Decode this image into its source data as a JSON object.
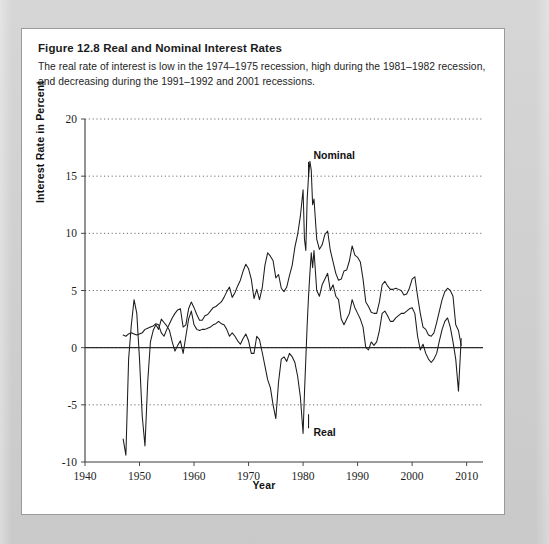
{
  "figure": {
    "label": "Figure 12.8",
    "title": "Real and Nominal Interest Rates",
    "caption": "The real rate of interest is low in the 1974–1975 recession, high during the 1981–1982 recession, and decreasing during the 1991–1992 and 2001 recessions."
  },
  "chart_data": {
    "type": "line",
    "title": "Real and Nominal Interest Rates",
    "xlabel": "Year",
    "ylabel": "Interest Rate in Percent",
    "xlim": [
      1940,
      2013
    ],
    "ylim": [
      -10,
      20
    ],
    "xticks": [
      1940,
      1950,
      1960,
      1970,
      1980,
      1990,
      2000,
      2010
    ],
    "yticks": [
      -10,
      -5,
      0,
      5,
      10,
      15,
      20
    ],
    "grid": "horizontal-dotted",
    "legend": "inline-annotations",
    "annotations": [
      {
        "text": "Nominal",
        "x": 1981,
        "y": 16.6
      },
      {
        "text": "Real",
        "x": 1981,
        "y": -7.4
      }
    ],
    "zero_line": 0,
    "series": [
      {
        "name": "Nominal",
        "x": [
          1947,
          1947.5,
          1948,
          1948.5,
          1949,
          1949.5,
          1950,
          1950.5,
          1951,
          1951.5,
          1952,
          1952.5,
          1953,
          1953.5,
          1954,
          1954.5,
          1955,
          1955.5,
          1956,
          1956.5,
          1957,
          1957.5,
          1958,
          1958.5,
          1959,
          1959.5,
          1960,
          1960.5,
          1961,
          1961.5,
          1962,
          1962.5,
          1963,
          1963.5,
          1964,
          1964.5,
          1965,
          1965.5,
          1966,
          1966.5,
          1967,
          1967.5,
          1968,
          1968.5,
          1969,
          1969.5,
          1970,
          1970.5,
          1971,
          1971.5,
          1972,
          1972.5,
          1973,
          1973.5,
          1974,
          1974.5,
          1975,
          1975.5,
          1976,
          1976.5,
          1977,
          1977.5,
          1978,
          1978.5,
          1979,
          1979.5,
          1980,
          1980.25,
          1980.5,
          1980.75,
          1981,
          1981.25,
          1981.5,
          1981.75,
          1982,
          1982.5,
          1983,
          1983.5,
          1984,
          1984.5,
          1985,
          1985.5,
          1986,
          1986.5,
          1987,
          1987.5,
          1988,
          1988.5,
          1989,
          1989.5,
          1990,
          1990.5,
          1991,
          1991.5,
          1992,
          1992.5,
          1993,
          1993.5,
          1994,
          1994.5,
          1995,
          1995.5,
          1996,
          1996.5,
          1997,
          1997.5,
          1998,
          1998.5,
          1999,
          1999.5,
          2000,
          2000.5,
          2001,
          2001.5,
          2002,
          2002.5,
          2003,
          2003.5,
          2004,
          2004.5,
          2005,
          2005.5,
          2006,
          2006.5,
          2007,
          2007.5,
          2008,
          2008.5,
          2009
        ],
        "y": [
          1.1,
          1.0,
          1.2,
          1.3,
          1.2,
          1.1,
          1.2,
          1.3,
          1.6,
          1.7,
          1.8,
          1.9,
          2.1,
          2.0,
          1.3,
          1.0,
          1.6,
          2.1,
          2.6,
          3.0,
          3.3,
          3.4,
          1.8,
          2.0,
          3.4,
          4.0,
          3.5,
          2.9,
          2.4,
          2.4,
          2.8,
          2.9,
          3.2,
          3.5,
          3.6,
          3.8,
          4.0,
          4.4,
          4.9,
          5.3,
          4.4,
          4.8,
          5.4,
          5.9,
          6.7,
          7.3,
          6.9,
          6.0,
          4.3,
          5.1,
          4.2,
          5.2,
          7.2,
          8.3,
          8.0,
          7.6,
          6.1,
          6.4,
          5.2,
          4.9,
          5.3,
          6.3,
          7.2,
          8.8,
          9.9,
          11.5,
          13.8,
          9.5,
          8.5,
          13.0,
          15.0,
          16.3,
          15.5,
          12.5,
          13.0,
          9.5,
          8.6,
          9.0,
          9.9,
          10.2,
          8.5,
          7.5,
          6.5,
          5.9,
          6.0,
          6.7,
          6.8,
          7.6,
          8.9,
          8.1,
          7.9,
          7.5,
          6.0,
          4.0,
          3.6,
          3.1,
          3.0,
          3.0,
          4.0,
          5.5,
          5.8,
          5.4,
          5.1,
          5.1,
          5.2,
          5.1,
          5.0,
          4.6,
          4.7,
          5.2,
          6.0,
          6.2,
          4.5,
          3.0,
          1.8,
          1.6,
          1.1,
          1.0,
          1.3,
          2.2,
          3.2,
          4.2,
          4.9,
          5.2,
          5.0,
          4.5,
          2.0,
          1.5,
          0.2
        ]
      },
      {
        "name": "Real",
        "x": [
          1947,
          1947.5,
          1948,
          1948.5,
          1949,
          1949.5,
          1950,
          1950.5,
          1951,
          1951.5,
          1952,
          1952.5,
          1953,
          1953.5,
          1954,
          1954.5,
          1955,
          1955.5,
          1956,
          1956.5,
          1957,
          1957.5,
          1958,
          1958.5,
          1959,
          1959.5,
          1960,
          1960.5,
          1961,
          1961.5,
          1962,
          1962.5,
          1963,
          1963.5,
          1964,
          1964.5,
          1965,
          1965.5,
          1966,
          1966.5,
          1967,
          1967.5,
          1968,
          1968.5,
          1969,
          1969.5,
          1970,
          1970.5,
          1971,
          1971.5,
          1972,
          1972.5,
          1973,
          1973.5,
          1974,
          1974.5,
          1975,
          1975.5,
          1976,
          1976.5,
          1977,
          1977.5,
          1978,
          1978.5,
          1979,
          1979.5,
          1980,
          1980.25,
          1980.5,
          1980.75,
          1981,
          1981.25,
          1981.5,
          1981.75,
          1982,
          1982.5,
          1983,
          1983.5,
          1984,
          1984.5,
          1985,
          1985.5,
          1986,
          1986.5,
          1987,
          1987.5,
          1988,
          1988.5,
          1989,
          1989.5,
          1990,
          1990.5,
          1991,
          1991.5,
          1992,
          1992.5,
          1993,
          1993.5,
          1994,
          1994.5,
          1995,
          1995.5,
          1996,
          1996.5,
          1997,
          1997.5,
          1998,
          1998.5,
          1999,
          1999.5,
          2000,
          2000.5,
          2001,
          2001.5,
          2002,
          2002.5,
          2003,
          2003.5,
          2004,
          2004.5,
          2005,
          2005.5,
          2006,
          2006.5,
          2007,
          2007.5,
          2008,
          2008.5,
          2009
        ],
        "y": [
          -8.0,
          -9.4,
          -1.0,
          2.0,
          4.2,
          3.0,
          -1.0,
          -6.0,
          -8.6,
          -3.0,
          0.5,
          1.5,
          2.0,
          1.6,
          2.5,
          2.2,
          1.9,
          1.5,
          0.5,
          -0.3,
          0.2,
          0.6,
          -0.5,
          1.0,
          2.5,
          3.2,
          2.0,
          1.6,
          1.5,
          1.6,
          1.6,
          1.7,
          1.8,
          2.0,
          2.1,
          2.3,
          2.1,
          2.0,
          1.6,
          1.0,
          1.3,
          1.0,
          0.6,
          0.3,
          0.8,
          1.2,
          0.6,
          -0.5,
          -0.5,
          1.0,
          0.7,
          -0.4,
          -1.6,
          -2.8,
          -3.5,
          -5.0,
          -6.2,
          -3.0,
          -1.0,
          -0.8,
          -1.2,
          -0.5,
          -0.8,
          -1.3,
          -2.5,
          -4.3,
          -7.5,
          -4.0,
          -1.0,
          2.0,
          4.5,
          6.5,
          8.3,
          7.0,
          8.5,
          5.0,
          4.5,
          5.5,
          6.0,
          6.5,
          5.0,
          5.5,
          4.5,
          4.2,
          2.5,
          2.0,
          2.5,
          3.0,
          4.2,
          3.5,
          3.0,
          2.5,
          1.8,
          0.0,
          -0.2,
          0.5,
          0.2,
          0.5,
          1.5,
          3.0,
          3.2,
          2.8,
          2.3,
          2.3,
          2.6,
          2.8,
          3.0,
          3.0,
          3.2,
          3.4,
          3.5,
          3.0,
          1.0,
          -0.2,
          0.3,
          -0.5,
          -1.0,
          -1.3,
          -1.0,
          -0.5,
          0.6,
          1.6,
          2.3,
          2.6,
          1.8,
          0.5,
          -1.0,
          -3.8,
          0.8
        ]
      }
    ]
  }
}
